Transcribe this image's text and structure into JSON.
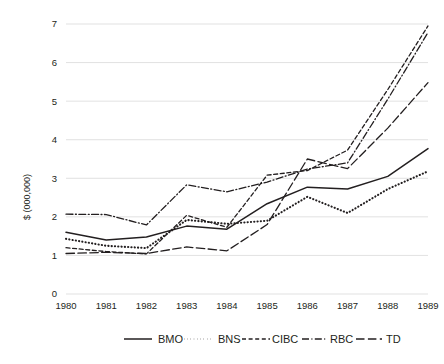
{
  "chart_data": {
    "type": "line",
    "title": "",
    "xlabel": "",
    "ylabel": "$ (000,000)",
    "categories": [
      "1980",
      "1981",
      "1982",
      "1983",
      "1984",
      "1985",
      "1986",
      "1987",
      "1988",
      "1989"
    ],
    "x": [
      1980,
      1981,
      1982,
      1983,
      1984,
      1985,
      1986,
      1987,
      1988,
      1989
    ],
    "ylim": [
      0,
      7
    ],
    "yticks": [
      0,
      1,
      2,
      3,
      4,
      5,
      6,
      7
    ],
    "ytick_labels": [
      "0",
      "1",
      "2",
      "3",
      "4",
      "5",
      "6",
      "7"
    ],
    "grid": "horizontal",
    "legend_position": "bottom",
    "series": [
      {
        "name": "BMO",
        "dash": "solid",
        "color": "#231f20",
        "values": [
          1.6,
          1.4,
          1.48,
          1.76,
          1.68,
          2.34,
          2.77,
          2.72,
          3.05,
          3.77
        ]
      },
      {
        "name": "BNS",
        "dash": "dotted",
        "color": "#231f20",
        "values": [
          1.43,
          1.25,
          1.19,
          1.92,
          1.82,
          1.9,
          2.52,
          2.1,
          2.72,
          3.18
        ]
      },
      {
        "name": "CIBC",
        "dash": "dashed-short",
        "color": "#231f20",
        "values": [
          1.2,
          1.1,
          1.04,
          2.04,
          1.73,
          3.08,
          3.2,
          3.73,
          5.3,
          6.95
        ]
      },
      {
        "name": "RBC",
        "dash": "dash-dot",
        "color": "#231f20",
        "values": [
          2.07,
          2.06,
          1.79,
          2.83,
          2.65,
          2.9,
          3.24,
          3.4,
          5.05,
          6.78
        ]
      },
      {
        "name": "TD",
        "dash": "dashed-long",
        "color": "#231f20",
        "values": [
          1.05,
          1.08,
          1.05,
          1.22,
          1.12,
          1.8,
          3.5,
          3.25,
          4.3,
          5.48
        ]
      }
    ]
  },
  "legend": {
    "items": [
      {
        "label": "BMO",
        "dash": "solid"
      },
      {
        "label": "BNS",
        "dash": "dotted"
      },
      {
        "label": "CIBC",
        "dash": "dashed-short"
      },
      {
        "label": "RBC",
        "dash": "dash-dot"
      },
      {
        "label": "TD",
        "dash": "dashed-long"
      }
    ]
  },
  "colors": {
    "ink": "#231f20",
    "grid": "#d9d9d9",
    "background": "#ffffff"
  }
}
